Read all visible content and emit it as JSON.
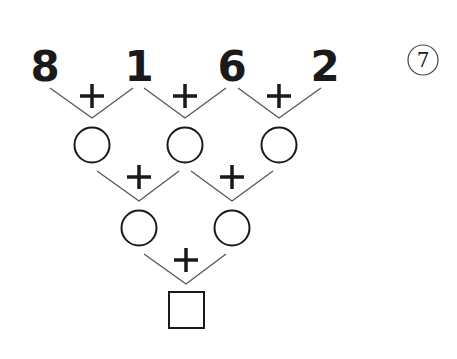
{
  "problem": {
    "number_label": "7",
    "top_numbers": [
      "8",
      "1",
      "6",
      "2"
    ],
    "operator": "+",
    "row1_blanks": 3,
    "row2_blanks": 2,
    "answer_box": ""
  },
  "colors": {
    "ink": "#1a1a1a",
    "line": "#555555",
    "background": "#ffffff"
  }
}
